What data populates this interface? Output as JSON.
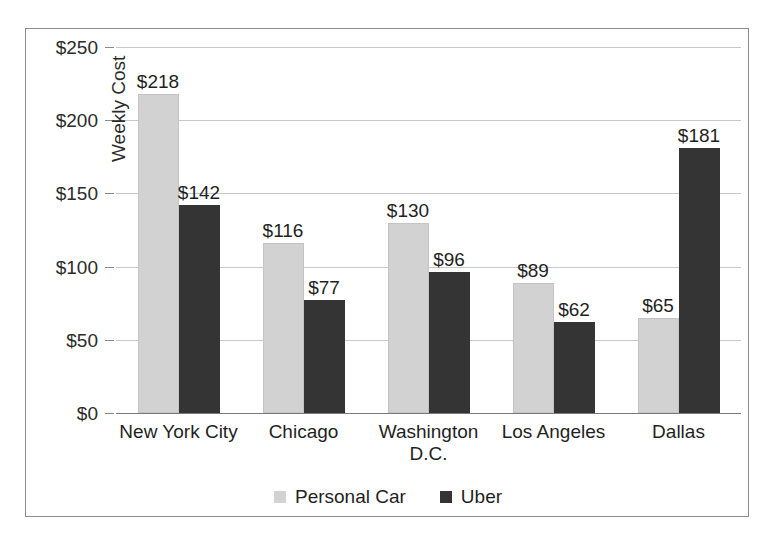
{
  "chart_data": {
    "type": "bar",
    "title": "",
    "xlabel": "",
    "ylabel": "Weekly Cost",
    "ylim": [
      0,
      250
    ],
    "ytick_values": [
      0,
      50,
      100,
      150,
      200,
      250
    ],
    "ytick_labels": [
      "$0",
      "$50",
      "$100",
      "$150",
      "$200",
      "$250"
    ],
    "grid": true,
    "legend_position": "bottom-center",
    "categories": [
      "New York City",
      "Chicago",
      "Washington D.C.",
      "Los Angeles",
      "Dallas"
    ],
    "category_lines": [
      [
        "New York City"
      ],
      [
        "Chicago"
      ],
      [
        "Washington",
        "D.C."
      ],
      [
        "Los Angeles"
      ],
      [
        "Dallas"
      ]
    ],
    "series": [
      {
        "name": "Personal Car",
        "color": "#d2d2d2",
        "values": [
          218,
          116,
          130,
          89,
          65
        ],
        "data_labels": [
          "$218",
          "$116",
          "$130",
          "$89",
          "$65"
        ]
      },
      {
        "name": "Uber",
        "color": "#343434",
        "values": [
          142,
          77,
          96,
          62,
          181
        ],
        "data_labels": [
          "$142",
          "$77",
          "$96",
          "$62",
          "$181"
        ]
      }
    ]
  }
}
